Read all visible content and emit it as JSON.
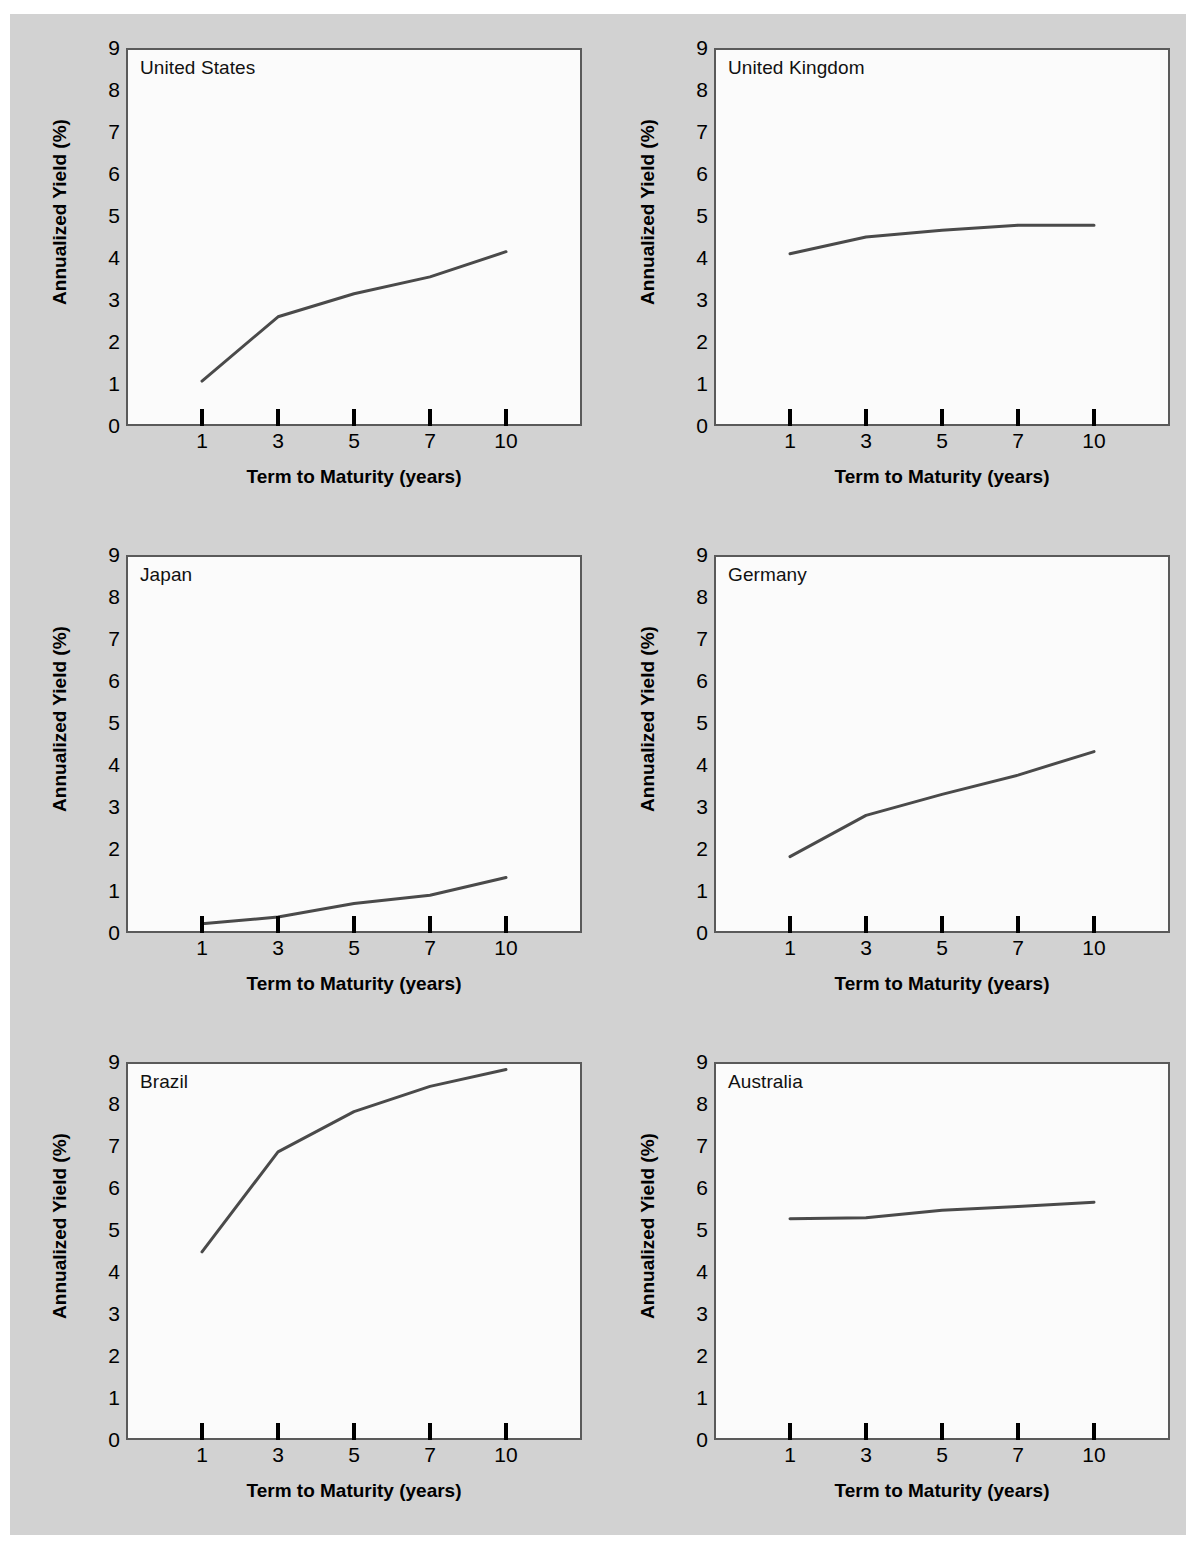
{
  "figure": {
    "background_color": "#d2d2d2",
    "panel_background_color": "#fbfbfb",
    "line_color": "#4a4a4a",
    "axis_color": "#5a5a5a"
  },
  "axes": {
    "ylabel": "Annualized Yield (%)",
    "xlabel": "Term  to Maturity (years)",
    "yticks": [
      "0",
      "1",
      "2",
      "3",
      "4",
      "5",
      "6",
      "7",
      "8",
      "9"
    ],
    "xticks": [
      "1",
      "3",
      "5",
      "7",
      "10"
    ],
    "ymin": 0,
    "ymax": 9
  },
  "chart_data": {
    "type": "line",
    "xlabel": "Term  to Maturity (years)",
    "ylabel": "Annualized Yield (%)",
    "categories": [
      "1",
      "3",
      "5",
      "7",
      "10"
    ],
    "x": [
      1,
      3,
      5,
      7,
      10
    ],
    "ylim": [
      0,
      9
    ],
    "grid": false,
    "legend": "none",
    "panels": [
      {
        "label": "United States",
        "values": [
          1.07,
          2.6,
          3.15,
          3.55,
          4.15
        ]
      },
      {
        "label": "United Kingdom",
        "values": [
          4.1,
          4.5,
          4.66,
          4.78,
          4.78
        ]
      },
      {
        "label": "Japan",
        "values": [
          0.22,
          0.38,
          0.7,
          0.9,
          1.32
        ]
      },
      {
        "label": "Germany",
        "values": [
          1.82,
          2.8,
          3.3,
          3.76,
          4.32
        ]
      },
      {
        "label": "Brazil",
        "values": [
          4.48,
          6.86,
          7.82,
          8.42,
          8.82
        ]
      },
      {
        "label": "Australia",
        "values": [
          5.27,
          5.29,
          5.47,
          5.56,
          5.66
        ]
      }
    ],
    "series": [
      {
        "name": "United States",
        "values": [
          1.07,
          2.6,
          3.15,
          3.55,
          4.15
        ]
      },
      {
        "name": "United Kingdom",
        "values": [
          4.1,
          4.5,
          4.66,
          4.78,
          4.78
        ]
      },
      {
        "name": "Japan",
        "values": [
          0.22,
          0.38,
          0.7,
          0.9,
          1.32
        ]
      },
      {
        "name": "Germany",
        "values": [
          1.82,
          2.8,
          3.3,
          3.76,
          4.32
        ]
      },
      {
        "name": "Brazil",
        "values": [
          4.48,
          6.86,
          7.82,
          8.42,
          8.82
        ]
      },
      {
        "name": "Australia",
        "values": [
          5.27,
          5.29,
          5.47,
          5.56,
          5.66
        ]
      }
    ]
  }
}
